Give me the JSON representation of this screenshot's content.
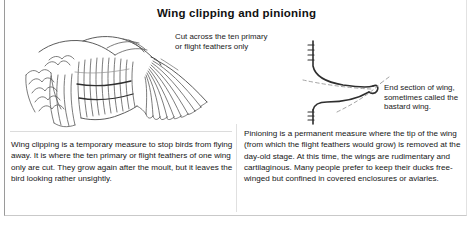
{
  "figure": {
    "title": "Wing clipping and pinioning"
  },
  "callouts": {
    "cut_line": "Cut across the ten primary\nor flight feathers only",
    "end_section": "End section of wing,\nsometimes called the\nbastard wing."
  },
  "body": {
    "wing_clipping": "Wing clipping is a temporary measure to stop birds from flying away. It is where the ten primary or flight feathers of one wing only are cut. They grow again after the moult, but it leaves the bird looking rather unsightly.",
    "pinioning": "Pinioning is a permanent measure where the tip of the wing (from which the flight feathers would grow) is removed at the day-old stage. At this time, the wings are rudimentary and cartilaginous. Many people prefer to keep their ducks free-winged  but confined in covered enclosures or aviaries."
  },
  "illustrations": {
    "wing": "bird-wing-line-drawing",
    "wingtip": "wing-tip-cross-section-line-drawing"
  },
  "colors": {
    "ink": "#1a1a1a",
    "line_art": "#4a4a4a",
    "border": "#9a9a9a",
    "divider": "#e0e0e0",
    "background": "#ffffff"
  }
}
